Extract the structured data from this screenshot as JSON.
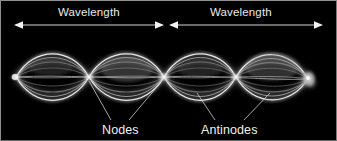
{
  "figure": {
    "background_color": "#000000",
    "border_color": "#8f8f8f",
    "width": 337,
    "height": 141
  },
  "annotations": {
    "wavelength_left": {
      "label": "Wavelength",
      "arrow": "double-headed-arrow",
      "span_start_x": 14,
      "span_end_x": 162,
      "y": 24
    },
    "wavelength_right": {
      "label": "Wavelength",
      "arrow": "double-headed-arrow",
      "span_start_x": 168,
      "span_end_x": 320,
      "y": 24
    },
    "nodes": {
      "label": "Nodes",
      "leader_targets_x": [
        88,
        163
      ],
      "leader_target_y": 80,
      "label_x": 101,
      "label_y": 123
    },
    "antinodes": {
      "label": "Antinodes",
      "leader_targets_x": [
        200,
        272
      ],
      "leader_target_y": 92,
      "label_x": 200,
      "label_y": 123
    }
  },
  "wave": {
    "description": "Time-exposure photograph of a string vibrating in its fourth harmonic, showing four antinode loops separated by nodes.",
    "axis_y": 76,
    "node_positions_x": [
      15,
      88,
      163,
      235,
      305
    ],
    "antinode_positions_x": [
      50,
      126,
      199,
      271
    ],
    "loop_count": 4,
    "max_amplitude_px": 34,
    "string_color": "#f2f2f2",
    "glow_color": "#bfbfbf",
    "driver_blob_x": 307,
    "driver_blob_y": 78
  },
  "colors": {
    "background": "#000000",
    "string_bright": "#ffffff",
    "string_glow": "#9a9a9a",
    "text": "#eeeeee",
    "arrow": "#d8d8d8",
    "leader_line": "#cccccc",
    "frame_border": "#8f8f8f"
  }
}
